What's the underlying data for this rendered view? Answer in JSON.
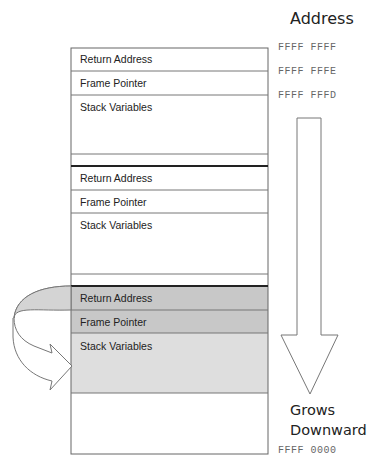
{
  "header": {
    "title": "Address"
  },
  "addresses": {
    "top": [
      "FFFF FFFF",
      "FFFF FFFE",
      "FFFF FFFD"
    ],
    "bottom": "FFFF 0000"
  },
  "frames": [
    {
      "return_address": "Return Address",
      "frame_pointer": "Frame Pointer",
      "stack_variables": "Stack Variables"
    },
    {
      "return_address": "Return Address",
      "frame_pointer": "Frame Pointer",
      "stack_variables": "Stack Variables"
    },
    {
      "return_address": "Return Address",
      "frame_pointer": "Frame Pointer",
      "stack_variables": "Stack Variables",
      "highlighted": true
    }
  ],
  "direction": {
    "line1": "Grows",
    "line2": "Downward"
  },
  "colors": {
    "highlight_dark": "#c8c8c8",
    "highlight_light": "#dedede",
    "border": "#555555",
    "arrow_fill": "#d4d4d4"
  }
}
